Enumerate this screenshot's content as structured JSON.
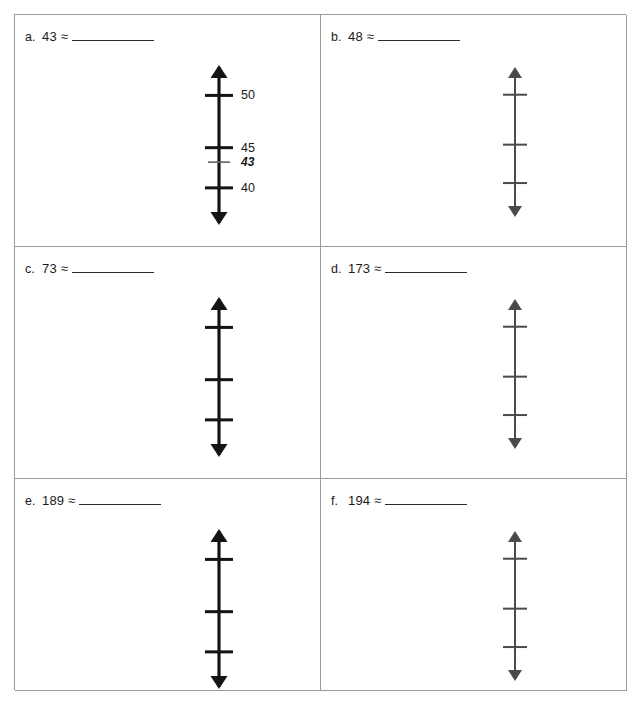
{
  "worksheet": {
    "title": "Rounding with Vertical Number Lines",
    "columns": 2,
    "rows": 3,
    "approx_symbol": "≈"
  },
  "style": {
    "page_background": "#ffffff",
    "border_color": "#9a9a9a",
    "ink_color": "#1a1a1a",
    "line_strong_color": "#141414",
    "line_light_color": "#4a4a4a",
    "minor_tick_color": "#6b6b6b"
  },
  "problems": [
    {
      "letter": "a.",
      "number": "43",
      "expression": "43 ≈",
      "answer": "",
      "line_weight": "strong",
      "labeled": true,
      "ticks": [
        {
          "label": "50",
          "kind": "major"
        },
        {
          "label": "45",
          "kind": "major"
        },
        {
          "label": "43",
          "kind": "minor"
        },
        {
          "label": "40",
          "kind": "major"
        }
      ]
    },
    {
      "letter": "b.",
      "number": "48",
      "expression": "48 ≈",
      "answer": "",
      "line_weight": "light",
      "labeled": false,
      "ticks": [
        {
          "label": "",
          "kind": "major"
        },
        {
          "label": "",
          "kind": "major"
        },
        {
          "label": "",
          "kind": "major"
        }
      ]
    },
    {
      "letter": "c.",
      "number": "73",
      "expression": "73 ≈",
      "answer": "",
      "line_weight": "strong",
      "labeled": false,
      "ticks": [
        {
          "label": "",
          "kind": "major"
        },
        {
          "label": "",
          "kind": "major"
        },
        {
          "label": "",
          "kind": "major"
        }
      ]
    },
    {
      "letter": "d.",
      "number": "173",
      "expression": "173 ≈",
      "answer": "",
      "line_weight": "light",
      "labeled": false,
      "ticks": [
        {
          "label": "",
          "kind": "major"
        },
        {
          "label": "",
          "kind": "major"
        },
        {
          "label": "",
          "kind": "major"
        }
      ]
    },
    {
      "letter": "e.",
      "number": "189",
      "expression": "189 ≈",
      "answer": "",
      "line_weight": "strong",
      "labeled": false,
      "ticks": [
        {
          "label": "",
          "kind": "major"
        },
        {
          "label": "",
          "kind": "major"
        },
        {
          "label": "",
          "kind": "major"
        }
      ]
    },
    {
      "letter": "f.",
      "number": "194",
      "expression": "194 ≈",
      "answer": "",
      "line_weight": "light",
      "labeled": false,
      "ticks": [
        {
          "label": "",
          "kind": "major"
        },
        {
          "label": "",
          "kind": "major"
        },
        {
          "label": "",
          "kind": "major"
        }
      ]
    }
  ]
}
